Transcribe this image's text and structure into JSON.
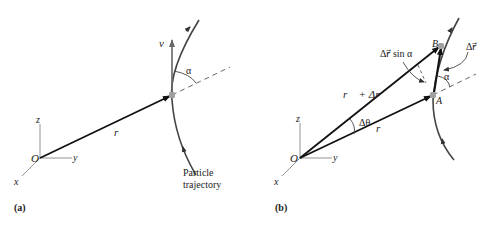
{
  "figure": {
    "panel_a": {
      "caption": "(a)",
      "origin_label": "O",
      "axis_x": "x",
      "axis_y": "y",
      "axis_z": "z",
      "position_vector_label": "r⃗",
      "velocity_vector_label": "v⃗",
      "angle_label": "α",
      "trajectory_label_line1": "Particle",
      "trajectory_label_line2": "trajectory"
    },
    "panel_b": {
      "caption": "(b)",
      "origin_label": "O",
      "axis_x": "x",
      "axis_y": "y",
      "axis_z": "z",
      "point_a_label": "A",
      "point_b_label": "B",
      "position_vector_label": "r⃗",
      "sum_vector_label": "r⃗ + Δr⃗",
      "delta_theta_label": "Δθ",
      "delta_r_label": "Δr⃗",
      "delta_r_sin_label": "Δr⃗ sin α",
      "angle_label": "α"
    },
    "colors": {
      "vector": "#111111",
      "trajectory": "#444444",
      "axes": "#777777",
      "point": "#a0a0a0"
    }
  }
}
